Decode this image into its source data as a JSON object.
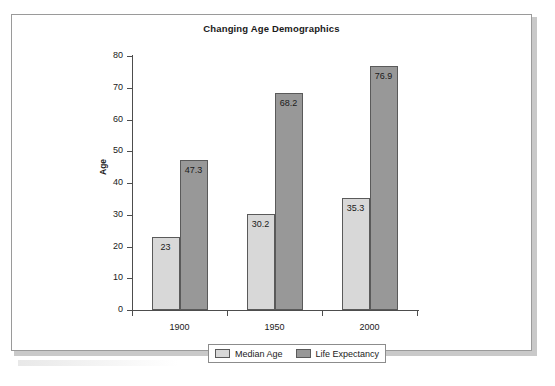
{
  "chart_data": {
    "type": "bar",
    "title": "Changing Age Demographics",
    "xlabel": "",
    "ylabel": "Age",
    "categories": [
      "1900",
      "1950",
      "2000"
    ],
    "series": [
      {
        "name": "Median Age",
        "color": "#d8d8d8",
        "values": [
          23,
          30.2,
          35.3
        ],
        "labels": [
          "23",
          "30.2",
          "35.3"
        ]
      },
      {
        "name": "Life Expectancy",
        "color": "#989898",
        "values": [
          47.3,
          68.2,
          76.9
        ],
        "labels": [
          "47.3",
          "68.2",
          "76.9"
        ]
      }
    ],
    "ylim": [
      0,
      80
    ],
    "yticks": [
      0,
      10,
      20,
      30,
      40,
      50,
      60,
      70,
      80
    ],
    "ytick_labels": [
      "0",
      "10",
      "20",
      "30",
      "40",
      "50",
      "60",
      "70",
      "80"
    ],
    "grid": false,
    "legend_position": "bottom"
  },
  "legend": {
    "items": [
      {
        "label": "Median Age"
      },
      {
        "label": "Life Expectancy"
      }
    ]
  }
}
